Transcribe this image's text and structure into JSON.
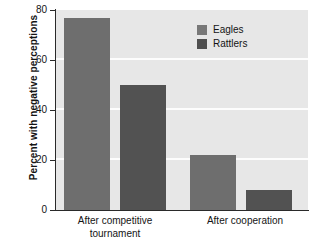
{
  "chart_data": {
    "type": "bar",
    "title": "",
    "subtitle": "",
    "xlabel": "",
    "ylabel": "Percent with negative perceptions",
    "categories": [
      "After competitive tournament",
      "After cooperation"
    ],
    "series": [
      {
        "name": "Eagles",
        "values": [
          77,
          22
        ],
        "color": "#6e6e6e"
      },
      {
        "name": "Rattlers",
        "values": [
          50,
          8
        ],
        "color": "#525252"
      }
    ],
    "ylim": [
      0,
      80
    ],
    "yticks": [
      0,
      20,
      40,
      60,
      80
    ],
    "ytick_labels": [
      "0",
      "20",
      "40",
      "60",
      "80"
    ],
    "grid": true,
    "grid_color": "#fdfdfd",
    "plot_background": "#e7e7e7",
    "legend_position": "top-right"
  },
  "axis": {
    "y_title": "Percent with negative perceptions",
    "tick_0": "0",
    "tick_20": "20",
    "tick_40": "40",
    "tick_60": "60",
    "tick_80": "80"
  },
  "categories": {
    "group1_line1": "After competitive",
    "group1_line2": "tournament",
    "group2_line1": "After cooperation"
  },
  "legend": {
    "item1": "Eagles",
    "item2": "Rattlers"
  }
}
